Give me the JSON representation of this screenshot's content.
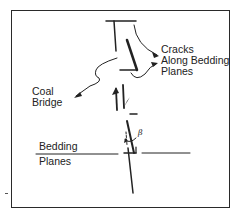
{
  "diagram": {
    "labels": {
      "cracks_line1": "Cracks",
      "cracks_line2": "Along Bedding",
      "cracks_line3": "Planes",
      "coal_line1": "Coal",
      "coal_line2": "Bridge",
      "bedding_line1": "Bedding",
      "bedding_line2": "Planes",
      "beta": "β"
    },
    "colors": {
      "line": "#222222",
      "background": "#ffffff"
    }
  }
}
